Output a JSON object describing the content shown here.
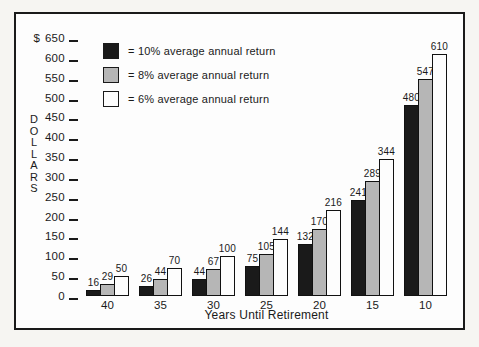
{
  "chart_data": {
    "type": "bar",
    "title": "",
    "xlabel": "Years Until Retirement",
    "ylabel": "DOLLARS",
    "currency_symbol": "$",
    "ylim": [
      0,
      650
    ],
    "ytick_step": 50,
    "yticks": [
      650,
      600,
      550,
      500,
      450,
      400,
      350,
      300,
      250,
      200,
      150,
      100,
      50,
      0
    ],
    "grid": false,
    "legend_position": "top-left",
    "categories": [
      "40",
      "35",
      "30",
      "25",
      "20",
      "15",
      "10"
    ],
    "series": [
      {
        "name": "10% average annual return",
        "legend_label": "= 10% average annual return",
        "color": "#1a1a1a",
        "values": [
          16,
          26,
          44,
          75,
          132,
          241,
          480
        ]
      },
      {
        "name": "8% average annual return",
        "legend_label": "= 8% average annual return",
        "color": "#b6b6b6",
        "values": [
          29,
          44,
          67,
          105,
          170,
          289,
          547
        ]
      },
      {
        "name": "6% average annual return",
        "legend_label": "= 6% average annual return",
        "color": "#fdfdfd",
        "values": [
          50,
          70,
          100,
          144,
          216,
          344,
          610
        ]
      }
    ]
  }
}
